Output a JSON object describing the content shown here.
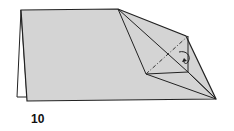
{
  "diagram": {
    "type": "origami-step",
    "step_number": "10",
    "paper_color": "#d4d4d4",
    "line_color": "#222222"
  }
}
